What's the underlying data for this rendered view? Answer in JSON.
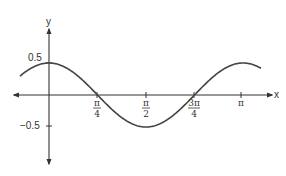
{
  "chart_data": {
    "type": "line",
    "title": "",
    "xlabel": "x",
    "ylabel": "y",
    "function": "y = 0.5 cos(2x)",
    "xlim": [
      -0.45,
      1.02
    ],
    "ylim": [
      -1.0,
      1.0
    ],
    "grid": false,
    "legend": null,
    "x_ticks": [
      {
        "value": 0.7854,
        "label_num": "π",
        "label_den": "4"
      },
      {
        "value": 1.5708,
        "label_num": "π",
        "label_den": "2"
      },
      {
        "value": 2.3562,
        "label_num": "3π",
        "label_den": "4"
      },
      {
        "value": 3.1416,
        "label_num": "π",
        "label_den": ""
      }
    ],
    "y_ticks": [
      {
        "value": 0.5,
        "label": "0.5"
      },
      {
        "value": -0.5,
        "label": "-0.5"
      }
    ],
    "series": [
      {
        "name": "curve",
        "x": [
          -0.59,
          0,
          0.7854,
          1.5708,
          2.3562,
          3.1416,
          3.46
        ],
        "y": [
          0.19,
          0.5,
          0,
          -0.5,
          0,
          0.5,
          0.39
        ]
      }
    ],
    "annotations": []
  },
  "axes": {
    "x_label": "x",
    "y_label": "y",
    "y_tick_pos": "0.5",
    "y_tick_neg": "−0.5",
    "x_ticks": [
      {
        "num": "π",
        "den": "4"
      },
      {
        "num": "π",
        "den": "2"
      },
      {
        "num": "3π",
        "den": "4"
      },
      {
        "num": "π",
        "den": ""
      }
    ]
  },
  "colors": {
    "axis": "#333333",
    "curve": "#444444",
    "background": "#ffffff"
  }
}
